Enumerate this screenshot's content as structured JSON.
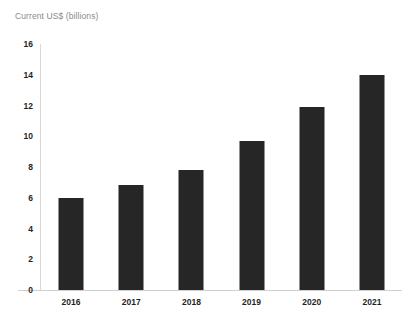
{
  "chart_data": {
    "type": "bar",
    "title": "Current US$ (billions)",
    "xlabel": "",
    "ylabel": "Current US$ (billions)",
    "categories": [
      "2016",
      "2017",
      "2018",
      "2019",
      "2020",
      "2021"
    ],
    "values": [
      6.0,
      6.8,
      7.8,
      9.7,
      11.9,
      14.0
    ],
    "ylim": [
      0,
      16
    ],
    "y_ticks": [
      "0",
      "2",
      "4",
      "6",
      "8",
      "10",
      "12",
      "14",
      "16"
    ],
    "y_tick_values": [
      0,
      2,
      4,
      6,
      8,
      10,
      12,
      14,
      16
    ],
    "grid": false,
    "legend": "none",
    "bar_color": "#262626",
    "axis_color": "#d8d8d8",
    "title_color": "#8a8a8a",
    "tick_label_color": "#1f1f1f",
    "background_color": "#ffffff"
  }
}
